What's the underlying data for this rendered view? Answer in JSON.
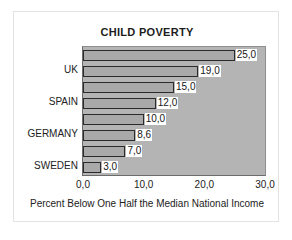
{
  "card": {
    "border_color": "#e3e3e3",
    "background": "#ffffff"
  },
  "chart_data": {
    "type": "bar",
    "orientation": "horizontal",
    "title": "CHILD POVERTY",
    "xlabel": "Percent Below One Half the Median National Income",
    "ylabel": "",
    "xlim": [
      0.0,
      30.0
    ],
    "xticks": [
      "0,0",
      "10,0",
      "20,0",
      "30,0"
    ],
    "xtick_values": [
      0.0,
      10.0,
      20.0,
      30.0
    ],
    "grid": false,
    "legend": "none",
    "decimal_separator": ",",
    "plot_background": "#b4b4b4",
    "bar_color": "#a9a9a9",
    "bar_border_color": "#2b2b2b",
    "categories": [
      "",
      "UK",
      "",
      "SPAIN",
      "",
      "GERMANY",
      "",
      "SWEDEN"
    ],
    "values": [
      25.0,
      19.0,
      15.0,
      12.0,
      10.0,
      8.6,
      7.0,
      3.0
    ],
    "value_labels": [
      "25,0",
      "19,0",
      "15,0",
      "12,0",
      "10,0",
      "8,6",
      "7,0",
      "3,0"
    ],
    "visible_category_labels": [
      {
        "index": 1,
        "label": "UK"
      },
      {
        "index": 3,
        "label": "SPAIN"
      },
      {
        "index": 5,
        "label": "GERMANY"
      },
      {
        "index": 7,
        "label": "SWEDEN"
      }
    ]
  }
}
